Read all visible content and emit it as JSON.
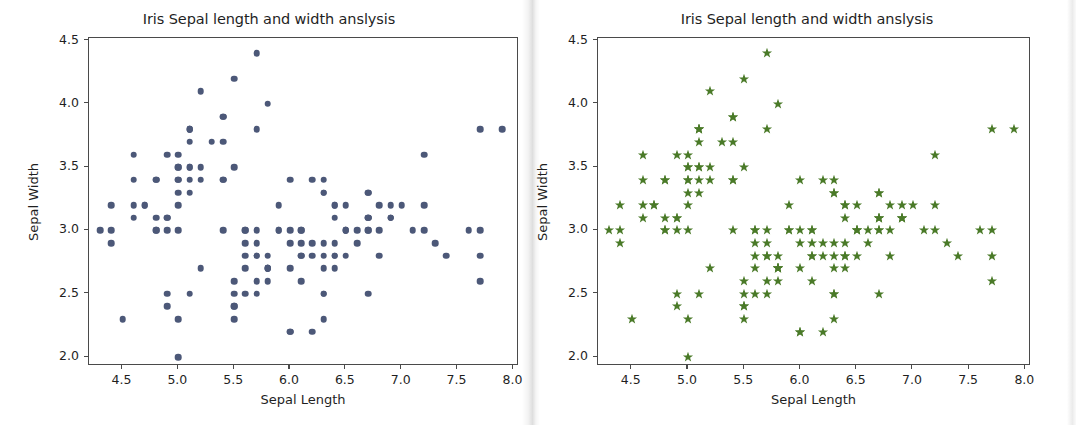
{
  "figure": {
    "background": "#ffffff",
    "width": 1076,
    "height": 425
  },
  "panels": [
    {
      "id": "left",
      "title": "Iris Sepal length and width anslysis",
      "xlabel": "Sepal Length",
      "ylabel": "Sepal Width",
      "marker": "circle",
      "color": "#4c5878"
    },
    {
      "id": "right",
      "title": "Iris Sepal length and width anslysis",
      "xlabel": "Sepal Length",
      "ylabel": "Sepal Width",
      "marker": "star",
      "color": "#4a7a28"
    }
  ],
  "chart_data": [
    {
      "type": "scatter",
      "title": "Iris Sepal length and width anslysis",
      "xlabel": "Sepal Length",
      "ylabel": "Sepal Width",
      "marker": "circle",
      "color": "#4c5878",
      "grid": false,
      "legend": "none",
      "xlim": [
        4.2,
        8.05
      ],
      "ylim": [
        1.93,
        4.52
      ],
      "xticks": [
        "4.5",
        "5.0",
        "5.5",
        "6.0",
        "6.5",
        "7.0",
        "7.5",
        "8.0"
      ],
      "xtick_values": [
        4.5,
        5.0,
        5.5,
        6.0,
        6.5,
        7.0,
        7.5,
        8.0
      ],
      "yticks": [
        "2.0",
        "2.5",
        "3.0",
        "3.5",
        "4.0",
        "4.5"
      ],
      "ytick_values": [
        2.0,
        2.5,
        3.0,
        3.5,
        4.0,
        4.5
      ],
      "x": [
        5.1,
        4.9,
        4.7,
        4.6,
        5.0,
        5.4,
        4.6,
        5.0,
        4.4,
        4.9,
        5.4,
        4.8,
        4.8,
        4.3,
        5.8,
        5.7,
        5.4,
        5.1,
        5.7,
        5.1,
        5.4,
        5.1,
        4.6,
        5.1,
        4.8,
        5.0,
        5.0,
        5.2,
        5.2,
        4.7,
        4.8,
        5.4,
        5.2,
        5.5,
        4.9,
        5.0,
        5.5,
        4.9,
        4.4,
        5.1,
        5.0,
        4.5,
        4.4,
        5.0,
        5.1,
        4.8,
        5.1,
        4.6,
        5.3,
        5.0,
        7.0,
        6.4,
        6.9,
        5.5,
        6.5,
        5.7,
        6.3,
        4.9,
        6.6,
        5.2,
        5.0,
        5.9,
        6.0,
        6.1,
        5.6,
        6.7,
        5.6,
        5.8,
        6.2,
        5.6,
        5.9,
        6.1,
        6.3,
        6.1,
        6.4,
        6.6,
        6.8,
        6.7,
        6.0,
        5.7,
        5.5,
        5.5,
        5.8,
        6.0,
        5.4,
        6.0,
        6.7,
        6.3,
        5.6,
        5.5,
        5.5,
        6.1,
        5.8,
        5.0,
        5.6,
        5.7,
        5.7,
        6.2,
        5.1,
        5.7,
        6.3,
        5.8,
        7.1,
        6.3,
        6.5,
        7.6,
        4.9,
        7.3,
        6.7,
        7.2,
        6.5,
        6.4,
        6.8,
        5.7,
        5.8,
        6.4,
        6.5,
        7.7,
        7.7,
        6.0,
        6.9,
        5.6,
        7.7,
        6.3,
        6.7,
        7.2,
        6.2,
        6.1,
        6.4,
        7.2,
        7.4,
        7.9,
        6.4,
        6.3,
        6.1,
        7.7,
        6.3,
        6.4,
        6.0,
        6.9,
        6.7,
        6.9,
        5.8,
        6.8,
        6.7,
        6.7,
        6.3,
        6.5,
        6.2,
        5.9
      ],
      "y": [
        3.5,
        3.0,
        3.2,
        3.1,
        3.6,
        3.9,
        3.4,
        3.4,
        2.9,
        3.1,
        3.7,
        3.4,
        3.0,
        3.0,
        4.0,
        4.4,
        3.9,
        3.5,
        3.8,
        3.8,
        3.4,
        3.7,
        3.6,
        3.3,
        3.4,
        3.0,
        3.4,
        3.5,
        3.4,
        3.2,
        3.1,
        3.4,
        4.1,
        4.2,
        3.1,
        3.2,
        3.5,
        3.6,
        3.0,
        3.4,
        3.5,
        2.3,
        3.2,
        3.5,
        3.8,
        3.0,
        3.8,
        3.2,
        3.7,
        3.3,
        3.2,
        3.2,
        3.1,
        2.3,
        2.8,
        2.8,
        3.3,
        2.4,
        2.9,
        2.7,
        2.0,
        3.0,
        2.2,
        2.9,
        2.9,
        3.1,
        3.0,
        2.7,
        2.2,
        2.5,
        3.2,
        2.8,
        2.5,
        2.8,
        2.9,
        3.0,
        2.8,
        3.0,
        2.9,
        2.6,
        2.4,
        2.4,
        2.7,
        2.7,
        3.0,
        3.4,
        3.1,
        2.3,
        3.0,
        2.5,
        2.6,
        3.0,
        2.6,
        2.3,
        2.7,
        3.0,
        2.9,
        2.9,
        2.5,
        2.8,
        3.3,
        2.7,
        3.0,
        2.9,
        3.0,
        3.0,
        2.5,
        2.9,
        2.5,
        3.6,
        3.2,
        2.7,
        3.0,
        2.5,
        2.8,
        3.2,
        3.0,
        3.8,
        2.6,
        2.2,
        3.2,
        2.8,
        2.8,
        2.7,
        3.3,
        3.2,
        2.8,
        3.0,
        2.8,
        3.0,
        2.8,
        3.8,
        2.8,
        2.8,
        2.6,
        3.0,
        3.4,
        3.1,
        3.0,
        3.1,
        3.1,
        3.1,
        2.7,
        3.2,
        3.3,
        3.0,
        2.5,
        3.0,
        3.4,
        3.0
      ]
    },
    {
      "type": "scatter",
      "title": "Iris Sepal length and width anslysis",
      "xlabel": "Sepal Length",
      "ylabel": "Sepal Width",
      "marker": "star",
      "color": "#4a7a28",
      "grid": false,
      "legend": "none",
      "xlim": [
        4.2,
        8.05
      ],
      "ylim": [
        1.93,
        4.52
      ],
      "xticks": [
        "4.5",
        "5.0",
        "5.5",
        "6.0",
        "6.5",
        "7.0",
        "7.5",
        "8.0"
      ],
      "xtick_values": [
        4.5,
        5.0,
        5.5,
        6.0,
        6.5,
        7.0,
        7.5,
        8.0
      ],
      "yticks": [
        "2.0",
        "2.5",
        "3.0",
        "3.5",
        "4.0",
        "4.5"
      ],
      "ytick_values": [
        2.0,
        2.5,
        3.0,
        3.5,
        4.0,
        4.5
      ],
      "x": [
        5.1,
        4.9,
        4.7,
        4.6,
        5.0,
        5.4,
        4.6,
        5.0,
        4.4,
        4.9,
        5.4,
        4.8,
        4.8,
        4.3,
        5.8,
        5.7,
        5.4,
        5.1,
        5.7,
        5.1,
        5.4,
        5.1,
        4.6,
        5.1,
        4.8,
        5.0,
        5.0,
        5.2,
        5.2,
        4.7,
        4.8,
        5.4,
        5.2,
        5.5,
        4.9,
        5.0,
        5.5,
        4.9,
        4.4,
        5.1,
        5.0,
        4.5,
        4.4,
        5.0,
        5.1,
        4.8,
        5.1,
        4.6,
        5.3,
        5.0,
        7.0,
        6.4,
        6.9,
        5.5,
        6.5,
        5.7,
        6.3,
        4.9,
        6.6,
        5.2,
        5.0,
        5.9,
        6.0,
        6.1,
        5.6,
        6.7,
        5.6,
        5.8,
        6.2,
        5.6,
        5.9,
        6.1,
        6.3,
        6.1,
        6.4,
        6.6,
        6.8,
        6.7,
        6.0,
        5.7,
        5.5,
        5.5,
        5.8,
        6.0,
        5.4,
        6.0,
        6.7,
        6.3,
        5.6,
        5.5,
        5.5,
        6.1,
        5.8,
        5.0,
        5.6,
        5.7,
        5.7,
        6.2,
        5.1,
        5.7,
        6.3,
        5.8,
        7.1,
        6.3,
        6.5,
        7.6,
        4.9,
        7.3,
        6.7,
        7.2,
        6.5,
        6.4,
        6.8,
        5.7,
        5.8,
        6.4,
        6.5,
        7.7,
        7.7,
        6.0,
        6.9,
        5.6,
        7.7,
        6.3,
        6.7,
        7.2,
        6.2,
        6.1,
        6.4,
        7.2,
        7.4,
        7.9,
        6.4,
        6.3,
        6.1,
        7.7,
        6.3,
        6.4,
        6.0,
        6.9,
        6.7,
        6.9,
        5.8,
        6.8,
        6.7,
        6.7,
        6.3,
        6.5,
        6.2,
        5.9
      ],
      "y": [
        3.5,
        3.0,
        3.2,
        3.1,
        3.6,
        3.9,
        3.4,
        3.4,
        2.9,
        3.1,
        3.7,
        3.4,
        3.0,
        3.0,
        4.0,
        4.4,
        3.9,
        3.5,
        3.8,
        3.8,
        3.4,
        3.7,
        3.6,
        3.3,
        3.4,
        3.0,
        3.4,
        3.5,
        3.4,
        3.2,
        3.1,
        3.4,
        4.1,
        4.2,
        3.1,
        3.2,
        3.5,
        3.6,
        3.0,
        3.4,
        3.5,
        2.3,
        3.2,
        3.5,
        3.8,
        3.0,
        3.8,
        3.2,
        3.7,
        3.3,
        3.2,
        3.2,
        3.1,
        2.3,
        2.8,
        2.8,
        3.3,
        2.4,
        2.9,
        2.7,
        2.0,
        3.0,
        2.2,
        2.9,
        2.9,
        3.1,
        3.0,
        2.7,
        2.2,
        2.5,
        3.2,
        2.8,
        2.5,
        2.8,
        2.9,
        3.0,
        2.8,
        3.0,
        2.9,
        2.6,
        2.4,
        2.4,
        2.7,
        2.7,
        3.0,
        3.4,
        3.1,
        2.3,
        3.0,
        2.5,
        2.6,
        3.0,
        2.6,
        2.3,
        2.7,
        3.0,
        2.9,
        2.9,
        2.5,
        2.8,
        3.3,
        2.7,
        3.0,
        2.9,
        3.0,
        3.0,
        2.5,
        2.9,
        2.5,
        3.6,
        3.2,
        2.7,
        3.0,
        2.5,
        2.8,
        3.2,
        3.0,
        3.8,
        2.6,
        2.2,
        3.2,
        2.8,
        2.8,
        2.7,
        3.3,
        3.2,
        2.8,
        3.0,
        2.8,
        3.0,
        2.8,
        3.8,
        2.8,
        2.8,
        2.6,
        3.0,
        3.4,
        3.1,
        3.0,
        3.1,
        3.1,
        3.1,
        2.7,
        3.2,
        3.3,
        3.0,
        2.5,
        3.0,
        3.4,
        3.0
      ]
    }
  ]
}
